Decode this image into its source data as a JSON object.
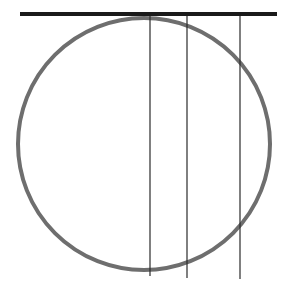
{
  "diagram": {
    "width": 284,
    "height": 293,
    "tangent_line": {
      "x1": 20,
      "y1": 14,
      "x2": 277,
      "y2": 14,
      "color": "#1a1a1a",
      "stroke_width": 4
    },
    "circle": {
      "cx": 144,
      "cy": 144,
      "r": 126,
      "color": "#6e6e6e",
      "stroke_width": 4
    },
    "vertical_lines": [
      {
        "x": 150,
        "y1": 14,
        "y2": 276,
        "color": "#2a2a2a",
        "stroke_width": 1.2
      },
      {
        "x": 187,
        "y1": 14,
        "y2": 278,
        "color": "#2a2a2a",
        "stroke_width": 1.2
      },
      {
        "x": 240,
        "y1": 14,
        "y2": 279,
        "color": "#2a2a2a",
        "stroke_width": 1.2
      }
    ]
  }
}
